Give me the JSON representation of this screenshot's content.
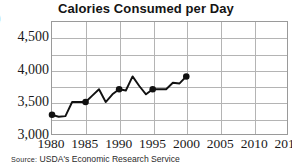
{
  "title": "Calories Consumed per Day",
  "edge_glyph": ")",
  "source": {
    "label": "Source:",
    "text": "USDA's Economic Research Service"
  },
  "axes": {
    "y_ticks": [
      "3,000",
      "3,500",
      "4,000",
      "4,500"
    ],
    "x_ticks": [
      "1980",
      "1985",
      "1990",
      "1995",
      "2000",
      "2005",
      "2010",
      "2015"
    ]
  },
  "colors": {
    "line": "#111111",
    "marker": "#111111",
    "grid": "#b4b4b4",
    "frame": "#9a9a9a",
    "text": "#1a1a1a"
  },
  "chart_data": {
    "type": "line",
    "title": "Calories Consumed per Day",
    "xlabel": "",
    "ylabel": "",
    "xlim": [
      1980,
      2015
    ],
    "ylim": [
      3000,
      4750
    ],
    "y_tick_values": [
      3000,
      3500,
      4000,
      4500
    ],
    "y_minor_step": 250,
    "x_tick_values": [
      1980,
      1985,
      1990,
      1995,
      2000,
      2005,
      2010,
      2015
    ],
    "grid": true,
    "legend": false,
    "marker_years": [
      1980,
      1985,
      1990,
      1995,
      2000
    ],
    "marker_values": [
      3300,
      3500,
      3700,
      3700,
      3900
    ],
    "x": [
      1980,
      1981,
      1982,
      1983,
      1984,
      1985,
      1986,
      1987,
      1988,
      1989,
      1990,
      1991,
      1992,
      1993,
      1994,
      1995,
      1996,
      1997,
      1998,
      1999,
      2000
    ],
    "values": [
      3300,
      3270,
      3280,
      3500,
      3500,
      3500,
      3600,
      3700,
      3500,
      3620,
      3700,
      3680,
      3900,
      3750,
      3620,
      3700,
      3700,
      3700,
      3800,
      3790,
      3900
    ],
    "series": [
      {
        "name": "Calories consumed per day",
        "values": [
          3300,
          3270,
          3280,
          3500,
          3500,
          3500,
          3600,
          3700,
          3500,
          3620,
          3700,
          3680,
          3900,
          3750,
          3620,
          3700,
          3700,
          3700,
          3800,
          3790,
          3900
        ]
      }
    ]
  }
}
